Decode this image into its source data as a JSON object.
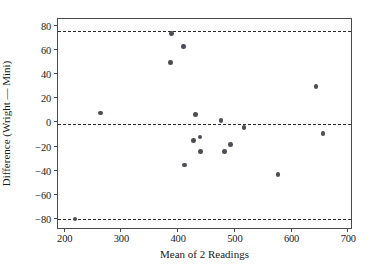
{
  "chart_data": {
    "type": "scatter",
    "title": "",
    "xlabel": "Mean of 2 Readings",
    "ylabel": "Difference (Wright — Mini)",
    "xlim": [
      190,
      710
    ],
    "ylim": [
      -90,
      85
    ],
    "xticks": [
      200,
      300,
      400,
      500,
      600,
      700
    ],
    "yticks": [
      80,
      60,
      40,
      20,
      0,
      -20,
      -40,
      -60,
      -80
    ],
    "grid": false,
    "legend": "none",
    "marker_color": "#4d4d55",
    "line_color": "#2b2b2b",
    "axis_color": "#4a4a4a",
    "points": [
      {
        "x": 220,
        "y": -81
      },
      {
        "x": 265,
        "y": 7
      },
      {
        "x": 388,
        "y": 49
      },
      {
        "x": 390,
        "y": 73
      },
      {
        "x": 411,
        "y": 62
      },
      {
        "x": 413,
        "y": -36
      },
      {
        "x": 429,
        "y": -16
      },
      {
        "x": 432,
        "y": 6
      },
      {
        "x": 440,
        "y": -13
      },
      {
        "x": 441,
        "y": -25
      },
      {
        "x": 477,
        "y": 1
      },
      {
        "x": 484,
        "y": -25
      },
      {
        "x": 494,
        "y": -19
      },
      {
        "x": 518,
        "y": -5
      },
      {
        "x": 578,
        "y": -44
      },
      {
        "x": 645,
        "y": 29
      },
      {
        "x": 657,
        "y": -10
      }
    ],
    "reference_lines": [
      {
        "name": "upper-limit-of-agreement",
        "y": 75,
        "style": "dashed"
      },
      {
        "name": "mean-difference",
        "y": -2,
        "style": "dashed"
      },
      {
        "name": "lower-limit-of-agreement",
        "y": -81,
        "style": "dashed"
      }
    ]
  }
}
